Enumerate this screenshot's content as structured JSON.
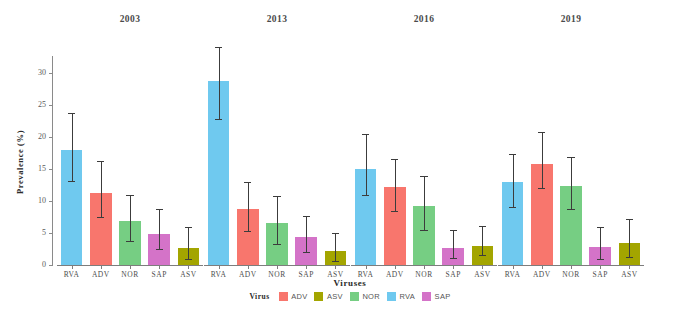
{
  "chart_data": {
    "type": "bar",
    "title": "",
    "xlabel": "Viruses",
    "ylabel": "Prevalence (%)",
    "ylim": [
      0,
      32
    ],
    "yticks": [
      0,
      5,
      10,
      15,
      20,
      25,
      30
    ],
    "ytick_labels": [
      "0",
      "5",
      "10",
      "15",
      "20",
      "25",
      "30"
    ],
    "grid": false,
    "legend_position": "bottom",
    "legend_title": "Virus",
    "categories": [
      "RVA",
      "ADV",
      "NOR",
      "SAP",
      "ASV"
    ],
    "panels": [
      "2003",
      "2013",
      "2016",
      "2019"
    ],
    "colors": {
      "ADV": "#F8766D",
      "ASV": "#A3A500",
      "NOR": "#76CE83",
      "RVA": "#6FC9EF",
      "SAP": "#D473C8"
    },
    "legend_entries": [
      {
        "label": "ADV",
        "color": "#F8766D"
      },
      {
        "label": "ASV",
        "color": "#A3A500"
      },
      {
        "label": "NOR",
        "color": "#76CE83"
      },
      {
        "label": "RVA",
        "color": "#6FC9EF"
      },
      {
        "label": "SAP",
        "color": "#D473C8"
      }
    ],
    "panel_data": [
      {
        "panel": "2003",
        "values": [
          17.9,
          11.3,
          6.8,
          4.9,
          2.6
        ],
        "err_low": [
          13.1,
          7.5,
          3.8,
          2.5,
          0.9
        ],
        "err_high": [
          23.7,
          16.2,
          10.9,
          8.8,
          5.9
        ]
      },
      {
        "panel": "2013",
        "values": [
          28.8,
          8.7,
          6.5,
          4.3,
          2.2
        ],
        "err_low": [
          22.8,
          5.3,
          3.3,
          2.0,
          0.7
        ],
        "err_high": [
          34.0,
          12.9,
          10.7,
          7.6,
          5.0
        ]
      },
      {
        "panel": "2016",
        "values": [
          15.0,
          12.2,
          9.2,
          2.6,
          3.0
        ],
        "err_low": [
          11.0,
          8.5,
          5.4,
          1.1,
          1.5
        ],
        "err_high": [
          20.5,
          16.6,
          13.9,
          5.4,
          6.1
        ]
      },
      {
        "panel": "2019",
        "values": [
          12.9,
          15.7,
          12.3,
          2.8,
          3.4
        ],
        "err_low": [
          9.0,
          12.0,
          8.8,
          1.0,
          1.2
        ],
        "err_high": [
          17.4,
          20.8,
          16.9,
          6.0,
          7.2
        ]
      }
    ]
  }
}
